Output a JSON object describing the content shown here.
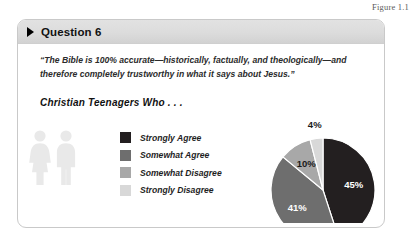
{
  "figure": {
    "caption": "Figure 1.1"
  },
  "card": {
    "header": {
      "triangle_icon": "play-triangle-icon",
      "title": "Question 6"
    },
    "quote": "“The Bible is 100% accurate—historically, factually, and theologically—and therefore completely trustworthy in what it says about Jesus.”",
    "subtitle": "Christian Teenagers Who . . .",
    "pictogram": {
      "name": "two-people-icon",
      "color": "#e8e8e8"
    }
  },
  "chart_data": {
    "type": "pie",
    "title": "Christian Teenagers Who . . .",
    "categories": [
      "Strongly Agree",
      "Somewhat Agree",
      "Somewhat Disagree",
      "Strongly Disagree"
    ],
    "values": [
      45,
      41,
      10,
      4
    ],
    "labels": [
      "45%",
      "41%",
      "10%",
      "4%"
    ],
    "colors": [
      "#231f20",
      "#6e6e6e",
      "#a8a8a8",
      "#d8d8d8"
    ],
    "start_angle_deg": 0,
    "direction": "clockwise",
    "legend_position": "left",
    "grid": false,
    "xlabel": "",
    "ylabel": ""
  },
  "legend": {
    "items": [
      {
        "label": "Strongly Agree",
        "color": "#231f20"
      },
      {
        "label": "Somewhat Agree",
        "color": "#6e6e6e"
      },
      {
        "label": "Somewhat Disagree",
        "color": "#a8a8a8"
      },
      {
        "label": "Strongly Disagree",
        "color": "#d8d8d8"
      }
    ]
  }
}
